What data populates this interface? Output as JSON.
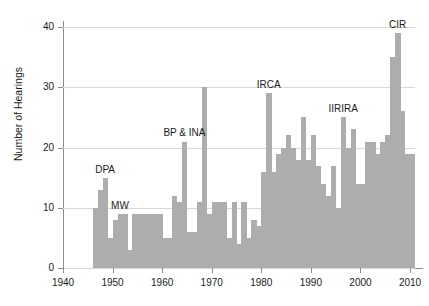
{
  "chart_data": {
    "type": "bar",
    "title": "",
    "xlabel": "",
    "ylabel": "Number of Hearings",
    "xlim": [
      1940,
      2011
    ],
    "ylim": [
      0,
      41
    ],
    "yticks": [
      0,
      10,
      20,
      30,
      40
    ],
    "xticks": [
      1940,
      1950,
      1960,
      1970,
      1980,
      1990,
      2000,
      2010
    ],
    "grid": true,
    "legend": false,
    "bar_color": "#adadad",
    "categories": [
      1946,
      1947,
      1948,
      1949,
      1950,
      1951,
      1952,
      1953,
      1954,
      1955,
      1956,
      1957,
      1958,
      1959,
      1960,
      1961,
      1962,
      1963,
      1964,
      1965,
      1966,
      1967,
      1968,
      1969,
      1970,
      1971,
      1972,
      1973,
      1974,
      1975,
      1976,
      1977,
      1978,
      1979,
      1980,
      1981,
      1982,
      1983,
      1984,
      1985,
      1986,
      1987,
      1988,
      1989,
      1990,
      1991,
      1992,
      1993,
      1994,
      1995,
      1996,
      1997,
      1998,
      1999,
      2000,
      2001,
      2002,
      2003,
      2004,
      2005,
      2006,
      2007,
      2008,
      2009,
      2010
    ],
    "values": [
      10,
      13,
      15,
      5,
      8,
      9,
      9,
      3,
      9,
      9,
      9,
      9,
      9,
      9,
      5,
      5,
      12,
      11,
      21,
      6,
      6,
      11,
      30,
      9,
      11,
      11,
      11,
      5,
      11,
      4,
      11,
      5,
      8,
      7,
      16,
      29,
      16,
      19,
      20,
      22,
      20,
      18,
      25,
      18,
      22,
      17,
      14,
      12,
      17,
      10,
      25,
      20,
      23,
      14,
      14,
      21,
      21,
      19,
      21,
      22,
      35,
      39,
      26,
      19,
      19
    ],
    "annotations": [
      {
        "label": "DPA",
        "year": 1948,
        "value": 15
      },
      {
        "label": "MW",
        "year": 1951,
        "value": 9
      },
      {
        "label": "BP & INA",
        "year": 1964,
        "value": 21
      },
      {
        "label": "IRCA",
        "year": 1981,
        "value": 29
      },
      {
        "label": "IIRIRA",
        "year": 1996,
        "value": 25
      },
      {
        "label": "CIR",
        "year": 2007,
        "value": 39
      }
    ]
  }
}
